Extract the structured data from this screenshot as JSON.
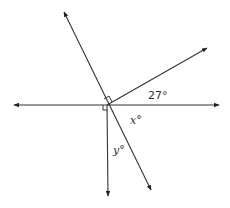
{
  "diagram": {
    "type": "geometry-angle-diagram",
    "center": {
      "x": 107,
      "y": 105
    },
    "lines": [
      {
        "name": "horizontal-line",
        "from": {
          "x": 14,
          "y": 105
        },
        "to": {
          "x": 219,
          "y": 105
        },
        "arrows": "both"
      },
      {
        "name": "oblique-line",
        "from": {
          "x": 64,
          "y": 12
        },
        "to": {
          "x": 151,
          "y": 190
        },
        "arrows": "both"
      },
      {
        "name": "ray-upper-right",
        "from": {
          "x": 107,
          "y": 105
        },
        "to": {
          "x": 207,
          "y": 48
        },
        "arrows": "end"
      },
      {
        "name": "ray-down",
        "from": {
          "x": 107,
          "y": 105
        },
        "to": {
          "x": 108,
          "y": 196
        },
        "arrows": "end"
      }
    ],
    "right_angle_marks": [
      {
        "name": "right-angle-mark-ray-oblique"
      },
      {
        "name": "right-angle-mark-horizontal-vertical"
      }
    ],
    "labels": {
      "angle_27": "27°",
      "angle_x": "x°",
      "angle_y": "y°"
    },
    "stroke_color": "#333333"
  }
}
